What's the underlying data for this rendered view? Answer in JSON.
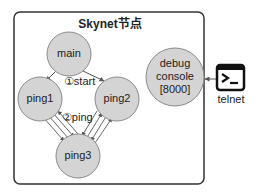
{
  "container": {
    "title": "Skynet节点"
  },
  "nodes": {
    "main": {
      "label": "main"
    },
    "ping1": {
      "label": "ping1"
    },
    "ping2": {
      "label": "ping2"
    },
    "ping3": {
      "label": "ping3"
    },
    "debug_console": {
      "line1": "debug",
      "line2": "console",
      "line3": "[8000]"
    }
  },
  "edges": {
    "start_label": "①start",
    "ping_label": "②ping"
  },
  "external": {
    "telnet": {
      "label": "telnet",
      "icon": "terminal-icon"
    }
  },
  "colors": {
    "node_fill": "#d4d4d4",
    "node_stroke": "#8a8a8a",
    "border": "#333333",
    "arrow": "#555555"
  }
}
